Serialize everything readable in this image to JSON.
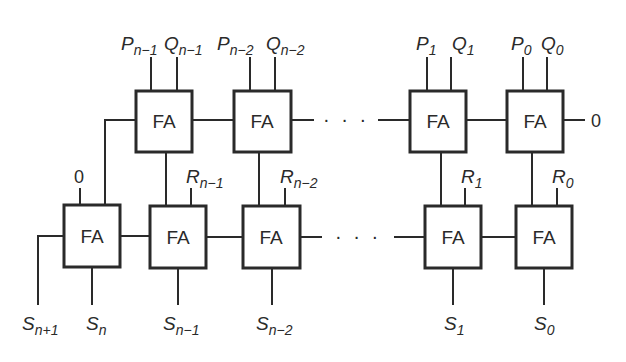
{
  "diagram": {
    "type": "array-multiplier-adder",
    "block_label": "FA",
    "ellipsis": "· · ·",
    "top_row": {
      "cells": [
        {
          "label": "FA",
          "inputs": [
            {
              "name": "P",
              "sub": "n−1"
            },
            {
              "name": "Q",
              "sub": "n−1"
            }
          ]
        },
        {
          "label": "FA",
          "inputs": [
            {
              "name": "P",
              "sub": "n−2"
            },
            {
              "name": "Q",
              "sub": "n−2"
            }
          ]
        },
        {
          "label": "FA",
          "inputs": [
            {
              "name": "P",
              "sub": "1"
            },
            {
              "name": "Q",
              "sub": "1"
            }
          ]
        },
        {
          "label": "FA",
          "inputs": [
            {
              "name": "P",
              "sub": "0"
            },
            {
              "name": "Q",
              "sub": "0"
            }
          ]
        }
      ],
      "carry_in": "0"
    },
    "bottom_row": {
      "cells": [
        {
          "label": "FA",
          "input": {
            "name": "0",
            "sub": ""
          }
        },
        {
          "label": "FA",
          "input": {
            "name": "R",
            "sub": "n−1"
          }
        },
        {
          "label": "FA",
          "input": {
            "name": "R",
            "sub": "n−2"
          }
        },
        {
          "label": "FA",
          "input": {
            "name": "R",
            "sub": "1"
          }
        },
        {
          "label": "FA",
          "input": {
            "name": "R",
            "sub": "0"
          }
        }
      ]
    },
    "outputs": [
      {
        "name": "S",
        "sub": "n+1"
      },
      {
        "name": "S",
        "sub": "n"
      },
      {
        "name": "S",
        "sub": "n−1"
      },
      {
        "name": "S",
        "sub": "n−2"
      },
      {
        "name": "S",
        "sub": "1"
      },
      {
        "name": "S",
        "sub": "0"
      }
    ]
  }
}
